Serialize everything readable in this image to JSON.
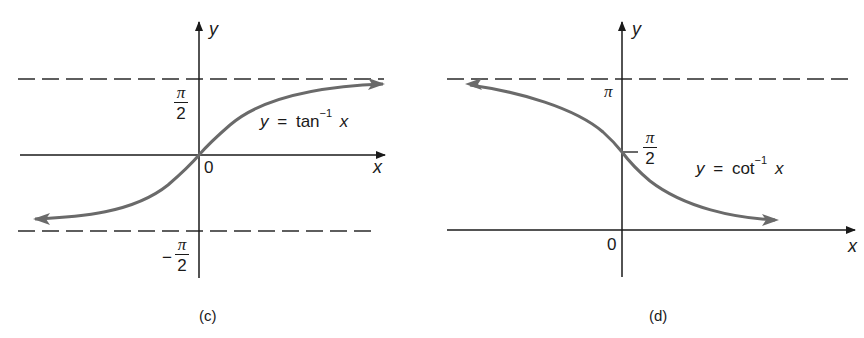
{
  "figure_c": {
    "caption": "(c)",
    "function_label": {
      "y": "y",
      "eq": "=",
      "fn": "tan",
      "exp": "−1",
      "x": "x"
    },
    "axis_labels": {
      "x": "x",
      "y": "y"
    },
    "origin_label": "0",
    "tick_labels": {
      "upper": {
        "numerator": "π",
        "denominator": "2"
      },
      "lower": {
        "sign": "−",
        "numerator": "π",
        "denominator": "2"
      }
    },
    "asymptotes": [
      "y = π/2",
      "y = −π/2"
    ]
  },
  "figure_d": {
    "caption": "(d)",
    "function_label": {
      "y": "y",
      "eq": "=",
      "fn": "cot",
      "exp": "−1",
      "x": "x"
    },
    "axis_labels": {
      "x": "x",
      "y": "y"
    },
    "origin_label": "0",
    "tick_labels": {
      "upper": {
        "text": "π"
      },
      "middle": {
        "numerator": "π",
        "denominator": "2"
      }
    },
    "asymptotes": [
      "y = π",
      "y = 0"
    ]
  },
  "colors": {
    "axis": "#1a1a1a",
    "curve": "#6a6a6a",
    "dash": "#2a2a2a",
    "background": "#ffffff"
  }
}
